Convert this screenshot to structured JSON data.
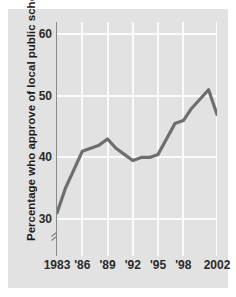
{
  "chart_data": {
    "type": "line",
    "title": "",
    "subtitle": "",
    "xlabel": "",
    "ylabel": "Percentage who approve of local public schools",
    "x": [
      1983,
      1984,
      1985,
      1986,
      1987,
      1988,
      1989,
      1990,
      1991,
      1992,
      1993,
      1994,
      1995,
      1996,
      1997,
      1998,
      1999,
      2000,
      2001,
      2002
    ],
    "values": [
      31,
      35,
      38,
      41,
      41.5,
      42,
      43,
      41.5,
      40.5,
      39.5,
      40,
      40,
      40.5,
      43,
      45.5,
      46,
      48,
      49.5,
      51,
      47
    ],
    "series": [
      {
        "name": "Percentage who approve of local public schools",
        "values": [
          31,
          35,
          38,
          41,
          41.5,
          42,
          43,
          41.5,
          40.5,
          39.5,
          40,
          40,
          40.5,
          43,
          45.5,
          46,
          48,
          49.5,
          51,
          47
        ],
        "color": "#6e6e6e"
      }
    ],
    "xlim": [
      1983,
      2002
    ],
    "ylim": [
      24,
      62
    ],
    "ytick_values": [
      30,
      40,
      50,
      60
    ],
    "ytick_labels": [
      "30",
      "40",
      "50",
      "60"
    ],
    "xtick_values": [
      1983,
      1986,
      1989,
      1992,
      1995,
      1998,
      2002
    ],
    "xtick_labels": [
      "1983",
      "'86",
      "'89",
      "'92",
      "'95",
      "'98",
      "2002"
    ],
    "grid": true,
    "grid_color": "#fbfbfb",
    "legend": false,
    "legend_position": "none",
    "axis_break": true,
    "axis_break_note": "y-axis broken below 30",
    "plot_background": "#e2e2e2",
    "line_color": "#6e6e6e",
    "axis_color": "#8a8a8a",
    "text_color": "#2b2b2b"
  }
}
